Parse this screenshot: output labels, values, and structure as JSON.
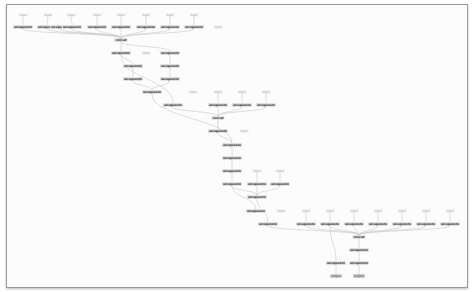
{
  "graph": {
    "edge_color": "#c8c8c8",
    "nodes": [
      {
        "id": "i1",
        "kind": "in",
        "label": "input",
        "x": 23,
        "y": 15
      },
      {
        "id": "i2",
        "kind": "in",
        "label": "input",
        "x": 48,
        "y": 15
      },
      {
        "id": "i3",
        "kind": "in",
        "label": "input",
        "x": 71,
        "y": 15
      },
      {
        "id": "i4",
        "kind": "in",
        "label": "input",
        "x": 97,
        "y": 15
      },
      {
        "id": "i5",
        "kind": "in",
        "label": "input",
        "x": 121,
        "y": 15
      },
      {
        "id": "i6",
        "kind": "in",
        "label": "input",
        "x": 146,
        "y": 15
      },
      {
        "id": "i7",
        "kind": "in",
        "label": "input",
        "x": 170,
        "y": 15
      },
      {
        "id": "i8",
        "kind": "in",
        "label": "input",
        "x": 194,
        "y": 15
      },
      {
        "id": "a1",
        "kind": "op",
        "label": "unsqueeze",
        "x": 23,
        "y": 27
      },
      {
        "id": "a2",
        "kind": "op",
        "label": "unsqueeze",
        "x": 47,
        "y": 27
      },
      {
        "id": "a3",
        "kind": "op",
        "label": "unsqueeze",
        "x": 60,
        "y": 27
      },
      {
        "id": "a4",
        "kind": "op",
        "label": "unsqueeze",
        "x": 72,
        "y": 27
      },
      {
        "id": "a5",
        "kind": "op",
        "label": "unsqueeze",
        "x": 97,
        "y": 27
      },
      {
        "id": "a6",
        "kind": "op",
        "label": "unsqueeze",
        "x": 121,
        "y": 27
      },
      {
        "id": "a7",
        "kind": "op",
        "label": "unsqueeze",
        "x": 146,
        "y": 27
      },
      {
        "id": "a8",
        "kind": "op",
        "label": "unsqueeze",
        "x": 170,
        "y": 27
      },
      {
        "id": "a9",
        "kind": "op",
        "label": "unsqueeze",
        "x": 194,
        "y": 27
      },
      {
        "id": "i9",
        "kind": "in",
        "label": "input",
        "x": 218,
        "y": 27
      },
      {
        "id": "b1",
        "kind": "op",
        "label": "concat",
        "x": 121,
        "y": 40
      },
      {
        "id": "b2",
        "kind": "op",
        "label": "unsqueeze",
        "x": 121,
        "y": 53
      },
      {
        "id": "i10",
        "kind": "in",
        "label": "input",
        "x": 146,
        "y": 53
      },
      {
        "id": "b3",
        "kind": "op",
        "label": "unsqueeze",
        "x": 170,
        "y": 53
      },
      {
        "id": "b4",
        "kind": "op",
        "label": "unsqueeze",
        "x": 133,
        "y": 66
      },
      {
        "id": "b5",
        "kind": "op",
        "label": "unsqueeze",
        "x": 170,
        "y": 66
      },
      {
        "id": "b6",
        "kind": "op",
        "label": "unsqueeze",
        "x": 133,
        "y": 79
      },
      {
        "id": "b7",
        "kind": "op",
        "label": "unsqueeze",
        "x": 170,
        "y": 79
      },
      {
        "id": "c1",
        "kind": "op",
        "label": "unsqueeze",
        "x": 152,
        "y": 92
      },
      {
        "id": "i11",
        "kind": "in",
        "label": "input",
        "x": 193,
        "y": 92
      },
      {
        "id": "i12",
        "kind": "in",
        "label": "input",
        "x": 218,
        "y": 92
      },
      {
        "id": "i13",
        "kind": "in",
        "label": "input",
        "x": 242,
        "y": 92
      },
      {
        "id": "i14",
        "kind": "in",
        "label": "input",
        "x": 266,
        "y": 92
      },
      {
        "id": "c2",
        "kind": "op",
        "label": "unsqueeze",
        "x": 173,
        "y": 105
      },
      {
        "id": "c3",
        "kind": "op",
        "label": "unsqueeze",
        "x": 218,
        "y": 105
      },
      {
        "id": "c4",
        "kind": "op",
        "label": "unsqueeze",
        "x": 242,
        "y": 105
      },
      {
        "id": "c5",
        "kind": "op",
        "label": "unsqueeze",
        "x": 266,
        "y": 105
      },
      {
        "id": "c6",
        "kind": "op",
        "label": "concat",
        "x": 218,
        "y": 118
      },
      {
        "id": "c7",
        "kind": "op",
        "label": "unsqueeze",
        "x": 218,
        "y": 131
      },
      {
        "id": "i15",
        "kind": "in",
        "label": "input",
        "x": 244,
        "y": 131
      },
      {
        "id": "d1",
        "kind": "op",
        "label": "unsqueeze",
        "x": 232,
        "y": 145
      },
      {
        "id": "d2",
        "kind": "op",
        "label": "unsqueeze",
        "x": 232,
        "y": 158
      },
      {
        "id": "d3",
        "kind": "op",
        "label": "unsqueeze",
        "x": 232,
        "y": 171
      },
      {
        "id": "i16",
        "kind": "in",
        "label": "input",
        "x": 257,
        "y": 171
      },
      {
        "id": "i17",
        "kind": "in",
        "label": "input",
        "x": 280,
        "y": 171
      },
      {
        "id": "d4",
        "kind": "op",
        "label": "unsqueeze",
        "x": 232,
        "y": 184
      },
      {
        "id": "d5",
        "kind": "op",
        "label": "unsqueeze",
        "x": 257,
        "y": 184
      },
      {
        "id": "d6",
        "kind": "op",
        "label": "unsqueeze",
        "x": 280,
        "y": 184
      },
      {
        "id": "d7",
        "kind": "op",
        "label": "unsqueeze",
        "x": 257,
        "y": 197
      },
      {
        "id": "e1",
        "kind": "op",
        "label": "unsqueeze",
        "x": 256,
        "y": 211
      },
      {
        "id": "i18",
        "kind": "in",
        "label": "input",
        "x": 281,
        "y": 211
      },
      {
        "id": "i19",
        "kind": "in",
        "label": "input",
        "x": 306,
        "y": 211
      },
      {
        "id": "i20",
        "kind": "in",
        "label": "input",
        "x": 330,
        "y": 211
      },
      {
        "id": "i21",
        "kind": "in",
        "label": "input",
        "x": 354,
        "y": 211
      },
      {
        "id": "i22",
        "kind": "in",
        "label": "input",
        "x": 378,
        "y": 211
      },
      {
        "id": "i23",
        "kind": "in",
        "label": "input",
        "x": 402,
        "y": 211
      },
      {
        "id": "i24",
        "kind": "in",
        "label": "input",
        "x": 426,
        "y": 211
      },
      {
        "id": "i25",
        "kind": "in",
        "label": "input",
        "x": 450,
        "y": 211
      },
      {
        "id": "e2",
        "kind": "op",
        "label": "unsqueeze",
        "x": 268,
        "y": 224
      },
      {
        "id": "e3",
        "kind": "op",
        "label": "unsqueeze",
        "x": 306,
        "y": 224
      },
      {
        "id": "e4",
        "kind": "op",
        "label": "unsqueeze",
        "x": 330,
        "y": 224
      },
      {
        "id": "e5",
        "kind": "op",
        "label": "unsqueeze",
        "x": 354,
        "y": 224
      },
      {
        "id": "e6",
        "kind": "op",
        "label": "unsqueeze",
        "x": 378,
        "y": 224
      },
      {
        "id": "e7",
        "kind": "op",
        "label": "unsqueeze",
        "x": 402,
        "y": 224
      },
      {
        "id": "e8",
        "kind": "op",
        "label": "unsqueeze",
        "x": 426,
        "y": 224
      },
      {
        "id": "e9",
        "kind": "op",
        "label": "unsqueeze",
        "x": 450,
        "y": 224
      },
      {
        "id": "f1",
        "kind": "op",
        "label": "concat",
        "x": 359,
        "y": 237
      },
      {
        "id": "f2",
        "kind": "op",
        "label": "unsqueeze",
        "x": 359,
        "y": 250
      },
      {
        "id": "f3",
        "kind": "op",
        "label": "unsqueeze",
        "x": 336,
        "y": 263
      },
      {
        "id": "f4",
        "kind": "op",
        "label": "unsqueeze",
        "x": 359,
        "y": 263
      },
      {
        "id": "o1",
        "kind": "out",
        "label": "output",
        "x": 336,
        "y": 276
      },
      {
        "id": "o2",
        "kind": "out",
        "label": "output",
        "x": 359,
        "y": 276
      }
    ],
    "edges": [
      [
        "i1",
        "a1"
      ],
      [
        "i2",
        "a2"
      ],
      [
        "i3",
        "a4"
      ],
      [
        "i4",
        "a5"
      ],
      [
        "i5",
        "a6"
      ],
      [
        "i6",
        "a7"
      ],
      [
        "i7",
        "a8"
      ],
      [
        "i8",
        "a9"
      ],
      [
        "a1",
        "b1"
      ],
      [
        "a2",
        "b1"
      ],
      [
        "a3",
        "b1"
      ],
      [
        "a4",
        "b1"
      ],
      [
        "a5",
        "b1"
      ],
      [
        "a6",
        "b1"
      ],
      [
        "a7",
        "b1"
      ],
      [
        "a8",
        "b1"
      ],
      [
        "a9",
        "b1"
      ],
      [
        "b1",
        "b2"
      ],
      [
        "b1",
        "b3"
      ],
      [
        "b2",
        "b4"
      ],
      [
        "b3",
        "b5"
      ],
      [
        "b4",
        "b6"
      ],
      [
        "b5",
        "b7"
      ],
      [
        "b6",
        "c1"
      ],
      [
        "b7",
        "c1"
      ],
      [
        "b2",
        "c2"
      ],
      [
        "i12",
        "c3"
      ],
      [
        "i13",
        "c4"
      ],
      [
        "i14",
        "c5"
      ],
      [
        "c2",
        "c6"
      ],
      [
        "c3",
        "c6"
      ],
      [
        "c4",
        "c6"
      ],
      [
        "c5",
        "c6"
      ],
      [
        "c6",
        "c7"
      ],
      [
        "c7",
        "d1"
      ],
      [
        "c1",
        "d1"
      ],
      [
        "d1",
        "d2"
      ],
      [
        "d2",
        "d3"
      ],
      [
        "d3",
        "d4"
      ],
      [
        "i16",
        "d5"
      ],
      [
        "i17",
        "d6"
      ],
      [
        "d4",
        "d7"
      ],
      [
        "d5",
        "d7"
      ],
      [
        "d6",
        "d7"
      ],
      [
        "d4",
        "e1"
      ],
      [
        "d7",
        "e2"
      ],
      [
        "i19",
        "e3"
      ],
      [
        "i20",
        "e4"
      ],
      [
        "i21",
        "e5"
      ],
      [
        "i22",
        "e6"
      ],
      [
        "i23",
        "e7"
      ],
      [
        "i24",
        "e8"
      ],
      [
        "i25",
        "e9"
      ],
      [
        "e2",
        "f1"
      ],
      [
        "e3",
        "f1"
      ],
      [
        "e4",
        "f1"
      ],
      [
        "e5",
        "f1"
      ],
      [
        "e6",
        "f1"
      ],
      [
        "e7",
        "f1"
      ],
      [
        "e8",
        "f1"
      ],
      [
        "e9",
        "f1"
      ],
      [
        "f1",
        "f2"
      ],
      [
        "f2",
        "f4"
      ],
      [
        "e4",
        "f3"
      ],
      [
        "f3",
        "o1"
      ],
      [
        "f4",
        "o2"
      ]
    ]
  }
}
